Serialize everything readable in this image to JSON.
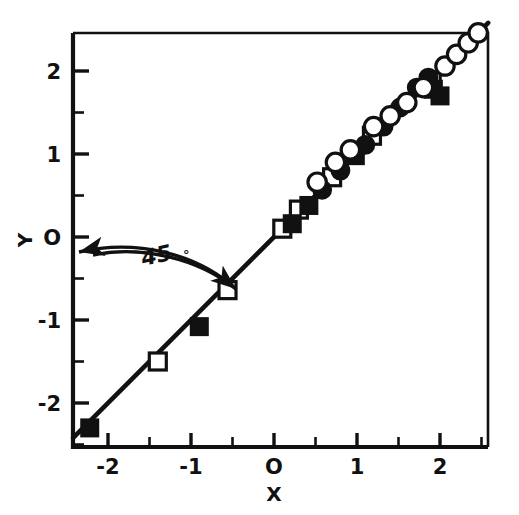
{
  "chart_data": {
    "type": "scatter",
    "title": "",
    "xlabel": "X",
    "ylabel": "Y",
    "xlim": [
      -2.42,
      2.58
    ],
    "ylim": [
      -2.5,
      2.5
    ],
    "grid": false,
    "legend": "none",
    "xticks": [
      -2,
      -1,
      0,
      1,
      2
    ],
    "xtick_labels": [
      "-2",
      "-1",
      "O",
      "1",
      "2"
    ],
    "yticks": [
      -2,
      -1,
      0,
      1,
      2
    ],
    "ytick_labels": [
      "-2",
      "-1",
      "O",
      "1",
      "2"
    ],
    "minor_tick_step": 0.5,
    "annotations": [
      {
        "text": "45",
        "degree_symbol": "°",
        "kind": "angle-label",
        "x": -1.3,
        "y": 0.05
      }
    ],
    "reference_line": {
      "kind": "identity",
      "label": "45 degree line",
      "slope": 1,
      "intercept": 0,
      "from": [
        -2.42,
        -2.42
      ],
      "to": [
        2.58,
        2.58
      ]
    },
    "series": [
      {
        "name": "open-square",
        "marker": "square-open",
        "points": [
          [
            -1.4,
            -1.5
          ],
          [
            -0.56,
            -0.64
          ],
          [
            0.1,
            0.1
          ],
          [
            0.3,
            0.33
          ],
          [
            0.7,
            0.72
          ],
          [
            1.18,
            1.22
          ],
          [
            1.9,
            1.88
          ]
        ]
      },
      {
        "name": "filled-square",
        "marker": "square-filled",
        "points": [
          [
            -2.22,
            -2.3
          ],
          [
            -0.9,
            -1.08
          ],
          [
            0.22,
            0.16
          ],
          [
            0.42,
            0.38
          ],
          [
            0.98,
            0.98
          ],
          [
            1.92,
            1.78
          ],
          [
            2.0,
            1.7
          ]
        ]
      },
      {
        "name": "filled-circle",
        "marker": "circle-filled",
        "points": [
          [
            0.58,
            0.57
          ],
          [
            0.8,
            0.8
          ],
          [
            1.1,
            1.11
          ],
          [
            1.32,
            1.33
          ],
          [
            1.52,
            1.56
          ],
          [
            1.72,
            1.8
          ],
          [
            1.86,
            1.92
          ]
        ]
      },
      {
        "name": "open-circle",
        "marker": "circle-open",
        "points": [
          [
            0.52,
            0.66
          ],
          [
            0.74,
            0.9
          ],
          [
            0.92,
            1.05
          ],
          [
            1.2,
            1.33
          ],
          [
            1.4,
            1.46
          ],
          [
            1.6,
            1.62
          ],
          [
            1.8,
            1.8
          ],
          [
            2.06,
            2.06
          ],
          [
            2.2,
            2.2
          ],
          [
            2.34,
            2.34
          ],
          [
            2.46,
            2.46
          ]
        ]
      }
    ]
  }
}
